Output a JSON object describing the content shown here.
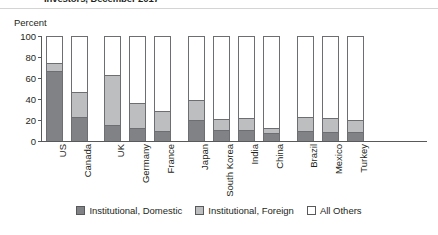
{
  "title": "Investors, December 2017",
  "axis": {
    "ylabel": "Percent",
    "yticks": [
      "0",
      "20",
      "40",
      "60",
      "80",
      "100"
    ]
  },
  "legend": {
    "items": [
      {
        "label": "Institutional, Domestic",
        "color": "#808285",
        "swatch": "sw-dom"
      },
      {
        "label": "Institutional, Foreign",
        "color": "#bcbec0",
        "swatch": "sw-for"
      },
      {
        "label": "All Others",
        "color": "#ffffff",
        "swatch": "sw-oth"
      }
    ]
  },
  "chart_data": {
    "type": "bar",
    "subtype": "stacked-vertical",
    "title": "Investors, December 2017",
    "xlabel": "",
    "ylabel": "Percent",
    "ylim": [
      0,
      100
    ],
    "yticks": [
      0,
      20,
      40,
      60,
      80,
      100
    ],
    "grid": false,
    "legend_position": "bottom-center",
    "stack_to_100": false,
    "note": "Each country bar is drawn to the full 100% frame; shaded segments show the institutional shares, unshaded remainder is All Others.",
    "categories": [
      "US",
      "Canada",
      "UK",
      "Germany",
      "France",
      "Japan",
      "South Korea",
      "India",
      "China",
      "Brazil",
      "Mexico",
      "Turkey"
    ],
    "group_breaks_after": [
      "Canada",
      "France",
      "China"
    ],
    "series": [
      {
        "name": "Institutional, Domestic",
        "color": "#808285",
        "values": [
          66,
          22,
          14,
          11,
          9,
          19,
          10,
          10,
          7,
          9,
          8,
          8
        ]
      },
      {
        "name": "Institutional, Foreign",
        "color": "#bcbec0",
        "values": [
          7,
          24,
          48,
          24,
          19,
          19,
          10,
          11,
          4,
          13,
          13,
          11
        ]
      },
      {
        "name": "All Others",
        "color": "#ffffff",
        "values": [
          27,
          54,
          38,
          65,
          72,
          62,
          80,
          79,
          89,
          78,
          79,
          81
        ]
      }
    ],
    "totals_institutional": [
      73,
      46,
      62,
      35,
      28,
      38,
      20,
      21,
      11,
      22,
      21,
      19
    ]
  },
  "layout": {
    "bar_slots_px": [
      4,
      29,
      62,
      87,
      112,
      146,
      171,
      196,
      221,
      255,
      280,
      305
    ],
    "bar_width_px": 17,
    "plot_width_px": 385,
    "plot_height_px": 105
  }
}
